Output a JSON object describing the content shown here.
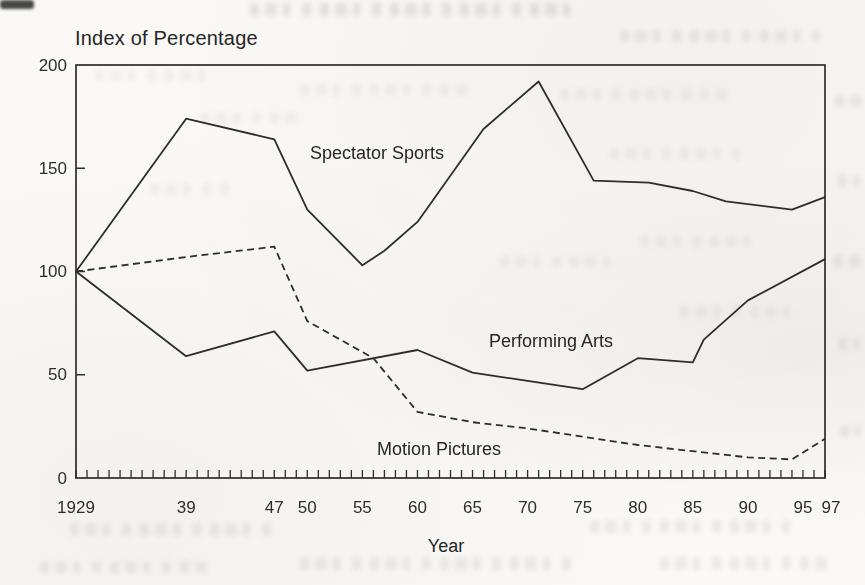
{
  "page": {
    "background_color": "#faf9f6",
    "ink_color": "#2d2d2d"
  },
  "chart_data": {
    "type": "line",
    "title": "Index of Percentage",
    "xlabel": "Year",
    "ylabel": "Index of Percentage",
    "xlim": [
      1929,
      1997
    ],
    "ylim": [
      0,
      200
    ],
    "grid": false,
    "legend_position": "inline-labels",
    "frame": "full-box",
    "y_ticks": [
      0,
      50,
      100,
      150,
      200
    ],
    "x_minor_tick_step": 1,
    "x_major_ticks": [
      {
        "year": 1929,
        "label": "1929",
        "dx": 0
      },
      {
        "year": 1939,
        "label": "39",
        "dx": 0
      },
      {
        "year": 1947,
        "label": "47",
        "dx": 0
      },
      {
        "year": 1950,
        "label": "50",
        "dx": 0
      },
      {
        "year": 1955,
        "label": "55",
        "dx": 0
      },
      {
        "year": 1960,
        "label": "60",
        "dx": 0
      },
      {
        "year": 1965,
        "label": "65",
        "dx": 0
      },
      {
        "year": 1970,
        "label": "70",
        "dx": 0
      },
      {
        "year": 1975,
        "label": "75",
        "dx": 0
      },
      {
        "year": 1980,
        "label": "80",
        "dx": 0
      },
      {
        "year": 1985,
        "label": "85",
        "dx": 0
      },
      {
        "year": 1990,
        "label": "90",
        "dx": 0
      },
      {
        "year": 1995,
        "label": "95",
        "dx": 0
      },
      {
        "year": 1997,
        "label": "97",
        "dx": 6
      }
    ],
    "series": [
      {
        "name": "Spectator Sports",
        "line_style": "solid",
        "label": {
          "text": "Spectator Sports",
          "x": 1950.2,
          "y": 158
        },
        "points": [
          [
            1929,
            100
          ],
          [
            1939,
            174
          ],
          [
            1947,
            164
          ],
          [
            1950,
            130
          ],
          [
            1955,
            103
          ],
          [
            1957,
            110
          ],
          [
            1960,
            124
          ],
          [
            1966,
            169
          ],
          [
            1971,
            192
          ],
          [
            1976,
            144
          ],
          [
            1981,
            143
          ],
          [
            1985,
            139
          ],
          [
            1988,
            134
          ],
          [
            1994,
            130
          ],
          [
            1997,
            136
          ]
        ]
      },
      {
        "name": "Performing Arts",
        "line_style": "solid",
        "label": {
          "text": "Performing Arts",
          "x": 1966.5,
          "y": 66
        },
        "points": [
          [
            1929,
            100
          ],
          [
            1939,
            59
          ],
          [
            1947,
            71
          ],
          [
            1950,
            52
          ],
          [
            1960,
            62
          ],
          [
            1965,
            51
          ],
          [
            1970,
            47
          ],
          [
            1975,
            43
          ],
          [
            1980,
            58
          ],
          [
            1985,
            56
          ],
          [
            1986,
            67
          ],
          [
            1990,
            86
          ],
          [
            1997,
            106
          ]
        ]
      },
      {
        "name": "Motion Pictures",
        "line_style": "dashed",
        "label": {
          "text": "Motion Pictures",
          "x": 1956.4,
          "y": 14
        },
        "points": [
          [
            1929,
            100
          ],
          [
            1939,
            107
          ],
          [
            1947,
            112
          ],
          [
            1950,
            76
          ],
          [
            1956,
            58
          ],
          [
            1960,
            32
          ],
          [
            1965,
            27
          ],
          [
            1970,
            24
          ],
          [
            1975,
            20
          ],
          [
            1980,
            16
          ],
          [
            1985,
            13
          ],
          [
            1990,
            10
          ],
          [
            1994,
            9
          ],
          [
            1997,
            19
          ]
        ]
      }
    ]
  }
}
